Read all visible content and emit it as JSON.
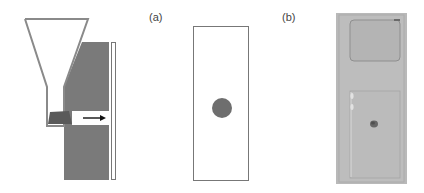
{
  "figure": {
    "panel_a": {
      "label": "(a)"
    },
    "panel_b": {
      "label": "(b)"
    }
  },
  "colors": {
    "funnel_stroke": "#8a8a8a",
    "block_fill": "#7a7a7a",
    "wedge_fill": "#5a5a5a",
    "dot_fill": "#6e6e6e",
    "slide_border": "#777777",
    "photo_bg": "#b9b9b9",
    "photo_inner": "#b3b3b3",
    "photo_line": "#8f8f8f"
  }
}
